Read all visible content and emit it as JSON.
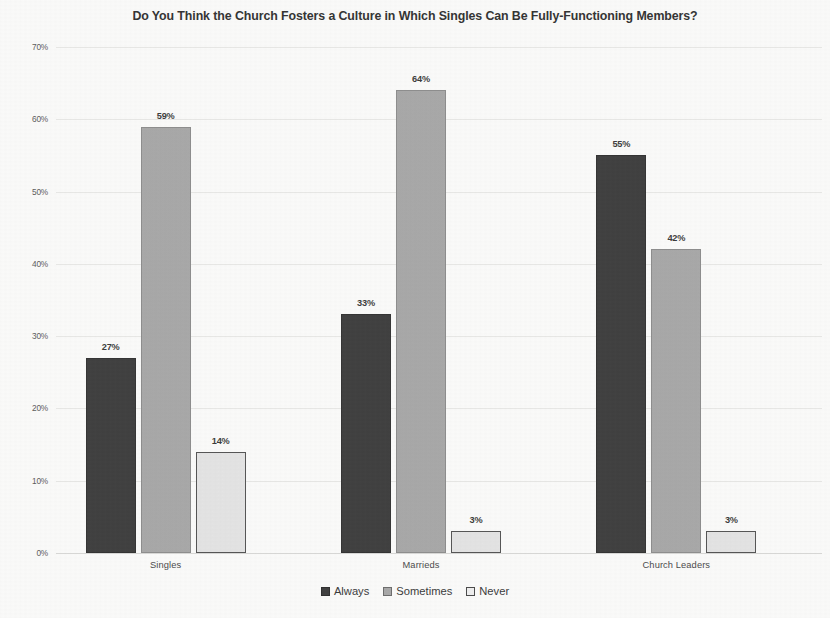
{
  "chart_data": {
    "type": "bar",
    "title": "Do You Think the Church Fosters a Culture in Which Singles Can Be Fully-Functioning Members?",
    "xlabel": "",
    "ylabel": "",
    "ylim": [
      0,
      70
    ],
    "y_tick_labels": [
      "70%",
      "60%",
      "50%",
      "40%",
      "30%",
      "20%",
      "10%",
      "0%"
    ],
    "y_tick_values": [
      70,
      60,
      50,
      40,
      30,
      20,
      10,
      0
    ],
    "grid": true,
    "grid_axis": "y",
    "legend_position": "bottom-center",
    "value_label_suffix": "%",
    "categories": [
      "Singles",
      "Marrieds",
      "Church Leaders"
    ],
    "series": [
      {
        "name": "Always",
        "color": "#3f3f3f",
        "values": [
          27,
          59,
          14
        ]
      },
      {
        "name": "Sometimes",
        "color": "#a8a8a8",
        "values": [
          33,
          64,
          3
        ]
      },
      {
        "name": "Never",
        "color": "#e4e4e4",
        "values": [
          55,
          42,
          3
        ]
      }
    ],
    "groups": [
      {
        "category": "Singles",
        "bars": [
          {
            "series": "Always",
            "value": 27,
            "label": "27%"
          },
          {
            "series": "Sometimes",
            "value": 59,
            "label": "59%"
          },
          {
            "series": "Never",
            "value": 14,
            "label": "14%"
          }
        ]
      },
      {
        "category": "Marrieds",
        "bars": [
          {
            "series": "Always",
            "value": 33,
            "label": "33%"
          },
          {
            "series": "Sometimes",
            "value": 64,
            "label": "64%"
          },
          {
            "series": "Never",
            "value": 3,
            "label": "3%"
          }
        ]
      },
      {
        "category": "Church Leaders",
        "bars": [
          {
            "series": "Always",
            "value": 55,
            "label": "55%"
          },
          {
            "series": "Sometimes",
            "value": 42,
            "label": "42%"
          },
          {
            "series": "Never",
            "value": 3,
            "label": "3%"
          }
        ]
      }
    ]
  },
  "legend": {
    "items": [
      {
        "label": "Always",
        "swatch": "always"
      },
      {
        "label": "Sometimes",
        "swatch": "sometimes"
      },
      {
        "label": "Never",
        "swatch": "never"
      }
    ]
  },
  "colors": {
    "always": "#3f3f3f",
    "sometimes": "#a8a8a8",
    "never": "#e4e4e4",
    "gridline": "#e8e8e6",
    "text": "#3a3a3a",
    "background": "#fbfbfa"
  }
}
